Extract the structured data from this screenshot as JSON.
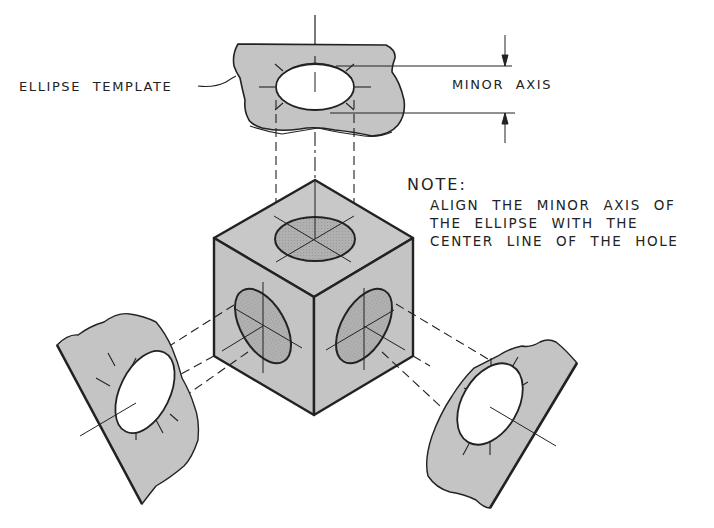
{
  "labels": {
    "ellipse_template": "ELLIPSE TEMPLATE",
    "minor_axis": "MINOR AXIS"
  },
  "note": {
    "title": "NOTE:",
    "lines": [
      "ALIGN THE MINOR AXIS OF",
      "THE ELLIPSE WITH THE",
      "CENTER LINE OF THE HOLE"
    ]
  },
  "components": {
    "top_template": "ellipse template (horizontal)",
    "cube": "isometric cube with elliptical holes on three faces",
    "left_template": "ellipse template aligned to left face",
    "right_template": "ellipse template aligned to right face"
  },
  "colors": {
    "template_fill": "#c4c4c4",
    "cube_fill": "#c6c6c6",
    "hole_fill": "#a9a9a9",
    "line": "#222222",
    "background": "#ffffff"
  }
}
